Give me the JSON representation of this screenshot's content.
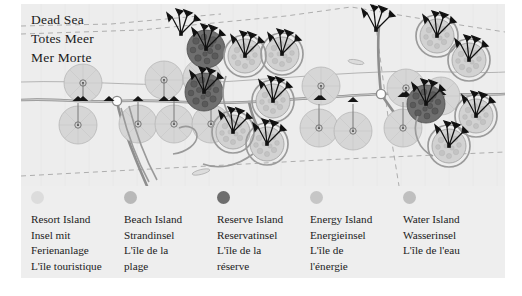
{
  "panel": {
    "background_color": "#eeeeee",
    "page_background_color": "#ffffff"
  },
  "map": {
    "title_lines": [
      "Dead Sea",
      "Totes Meer",
      "Mer Morte"
    ],
    "water_color": "#e9e9e9",
    "land_color": "#ececec",
    "road_color": "#9a9a9a",
    "island_colors": {
      "resort": "#d8d8d8",
      "beach": "#cfcfcf",
      "reserve": "#707070",
      "energy": "#d2d2d2",
      "water": "#cdcdcd"
    },
    "structure_color": "#1a1a1a"
  },
  "legend": {
    "items": [
      {
        "key": "resort",
        "dot_color": "#dcdcdc",
        "lines": [
          "Resort Island",
          "Insel mit",
          "Ferienanlage",
          "L'île touristique"
        ]
      },
      {
        "key": "beach",
        "dot_color": "#b8b8b8",
        "lines": [
          "Beach Island",
          "Strandinsel",
          "L'île de la",
          "plage"
        ]
      },
      {
        "key": "reserve",
        "dot_color": "#6e6e6e",
        "lines": [
          "Reserve Island",
          "Reservatinsel",
          "L'île de la",
          "réserve"
        ]
      },
      {
        "key": "energy",
        "dot_color": "#c6c6c6",
        "lines": [
          "Energy Island",
          "Energieinsel",
          "L'île de",
          "l'énergie"
        ]
      },
      {
        "key": "water",
        "dot_color": "#bfbfbf",
        "lines": [
          "Water Island",
          "Wasserinsel",
          "L'île de l'eau"
        ]
      }
    ]
  }
}
